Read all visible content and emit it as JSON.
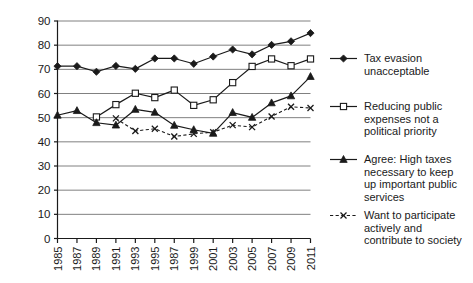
{
  "chart_data": {
    "type": "line",
    "title": "",
    "subtitle": "",
    "xlabel": "",
    "ylabel": "",
    "ylim": [
      0,
      90
    ],
    "ytick_step": 10,
    "yticks": [
      "0",
      "10",
      "20",
      "30",
      "40",
      "50",
      "60",
      "70",
      "80",
      "90"
    ],
    "grid": "horizontal",
    "legend_position": "right",
    "categories": [
      "1985",
      "1987",
      "1989",
      "1991",
      "1993",
      "1995",
      "1987",
      "1999",
      "2001",
      "2003",
      "2005",
      "2007",
      "2009",
      "2011"
    ],
    "series": [
      {
        "name": "Tax evasion unacceptable",
        "marker": "filled-diamond",
        "line": "solid",
        "values": [
          71.3,
          71.3,
          69.0,
          71.4,
          70.2,
          74.5,
          74.5,
          72.3,
          75.3,
          78.2,
          76.2,
          80.1,
          81.6,
          85.0
        ]
      },
      {
        "name": "Reducing public expenses not a political priority",
        "marker": "open-square",
        "line": "solid",
        "values": [
          null,
          null,
          50.3,
          55.4,
          60.1,
          58.3,
          61.4,
          55.1,
          57.4,
          64.5,
          71.2,
          74.3,
          71.5,
          74.3
        ]
      },
      {
        "name": "Agree: High taxes necessary to keep up important public services",
        "marker": "filled-triangle",
        "line": "solid",
        "values": [
          51.0,
          52.9,
          47.9,
          46.9,
          53.4,
          52.2,
          46.8,
          45.0,
          43.5,
          52.1,
          50.1,
          56.1,
          59.0,
          67.0
        ]
      },
      {
        "name": "Want to participate actively and contribute to society",
        "marker": "cross-x",
        "line": "dashed",
        "values": [
          null,
          null,
          null,
          49.7,
          44.5,
          45.4,
          42.2,
          43.3,
          44.0,
          46.9,
          46.1,
          50.5,
          54.5,
          54.0
        ]
      }
    ]
  },
  "legend": {
    "items": [
      {
        "label": "Tax evasion\nunacceptable",
        "marker": "filled-diamond",
        "line": "solid"
      },
      {
        "label": "Reducing public\nexpenses not a\npolitical priority",
        "marker": "open-square",
        "line": "solid"
      },
      {
        "label": "Agree: High taxes\nnecessary to keep\nup important public\nservices",
        "marker": "filled-triangle",
        "line": "solid"
      },
      {
        "label": "Want to participate\nactively and\ncontribute to society",
        "marker": "cross-x",
        "line": "dashed"
      }
    ]
  },
  "colors": {
    "line": "#1a1a1a",
    "grid": "#808080",
    "axis": "#1a1a1a",
    "background": "#ffffff",
    "marker_fill": "#1a1a1a",
    "marker_open": "#ffffff"
  }
}
